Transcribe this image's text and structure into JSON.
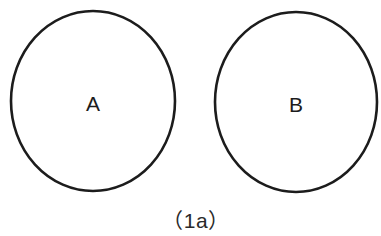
{
  "figure": {
    "background_color": "#ffffff",
    "stroke_color": "#1c1c1c",
    "label_color": "#1c1c1c",
    "caption_color": "#2a2a2a",
    "caption": "（1a）",
    "caption_plain": "(1a)",
    "width": 381,
    "height": 236,
    "shapes": [
      {
        "name": "circle-a",
        "label": "A",
        "cx": 93,
        "cy": 101,
        "rx": 82,
        "ry": 90,
        "stroke_width": 2.6,
        "clipped": false
      },
      {
        "name": "circle-b",
        "label": "B",
        "cx": 296,
        "cy": 102,
        "rx": 81,
        "ry": 90,
        "stroke_width": 2.6,
        "clipped": true
      }
    ]
  },
  "chart_data": {
    "type": "diagram",
    "title": "（1a）",
    "elements": [
      {
        "id": "A",
        "shape": "circle",
        "label": "A"
      },
      {
        "id": "B",
        "shape": "circle",
        "label": "B"
      }
    ],
    "relation": "disjoint",
    "legend": [],
    "grid": false
  }
}
